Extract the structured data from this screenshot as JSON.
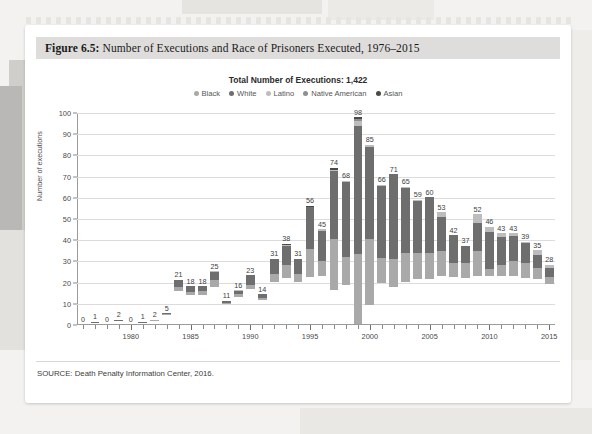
{
  "figure": {
    "label": "Figure 6.5:",
    "title": " Number of Executions and Race of Prisoners Executed, 1976–2015",
    "source": "SOURCE: Death Penalty Information Center, 2016."
  },
  "colors": {
    "black": "#a9a9a9",
    "white": "#6e6e6e",
    "latino": "#bdbdbd",
    "native_american": "#8f8f8f",
    "asian": "#4a4a4a",
    "gridline": "#dcdcdc",
    "axis": "#9b9b9b",
    "title_band": "#dedddb",
    "card": "#ffffff"
  },
  "chart_data": {
    "type": "bar",
    "stacked": true,
    "title": "Total Number of Executions: 1,422",
    "xlabel": "",
    "ylabel": "Number of executions",
    "ylim": [
      0,
      100
    ],
    "ytick_step": 10,
    "yticks": [
      0,
      10,
      20,
      30,
      40,
      50,
      60,
      70,
      80,
      90,
      100
    ],
    "grid": true,
    "legend_position": "top",
    "legend": [
      "Black",
      "White",
      "Latino",
      "Native American",
      "Asian"
    ],
    "categories": [
      "1976",
      "1977",
      "1978",
      "1979",
      "1980",
      "1981",
      "1982",
      "1983",
      "1984",
      "1985",
      "1986",
      "1987",
      "1988",
      "1989",
      "1990",
      "1991",
      "1992",
      "1993",
      "1994",
      "1995",
      "1996",
      "1997",
      "1998",
      "1999",
      "2000",
      "2001",
      "2002",
      "2003",
      "2004",
      "2005",
      "2006",
      "2007",
      "2008",
      "2009",
      "2010",
      "2011",
      "2012",
      "2013",
      "2014",
      "2015"
    ],
    "xtick_labels": [
      "1980",
      "1985",
      "1990",
      "1995",
      "2000",
      "2005",
      "2010",
      "2015"
    ],
    "totals": [
      0,
      1,
      0,
      2,
      0,
      1,
      2,
      5,
      21,
      18,
      18,
      25,
      11,
      16,
      23,
      14,
      31,
      38,
      31,
      56,
      45,
      74,
      68,
      98,
      85,
      66,
      71,
      65,
      59,
      60,
      53,
      42,
      37,
      52,
      46,
      43,
      43,
      39,
      35,
      28
    ],
    "series": [
      {
        "name": "Black",
        "color": "#a9a9a9",
        "values": [
          0,
          0,
          0,
          0,
          0,
          0,
          1,
          1,
          8,
          5,
          7,
          11,
          4,
          7,
          7,
          6,
          11,
          14,
          11,
          22,
          14,
          31,
          18,
          33,
          35,
          17,
          18,
          20,
          19,
          19,
          21,
          14,
          17,
          21,
          7,
          11,
          15,
          16,
          14,
          10
        ]
      },
      {
        "name": "White",
        "color": "#6e6e6e",
        "values": [
          0,
          1,
          0,
          2,
          0,
          1,
          1,
          4,
          13,
          13,
          11,
          13,
          6,
          8,
          16,
          8,
          19,
          22,
          19,
          33,
          29,
          41,
          49,
          61,
          49,
          48,
          53,
          44,
          39,
          41,
          28,
          28,
          20,
          24,
          34,
          28,
          25,
          22,
          15,
          14
        ]
      },
      {
        "name": "Latino",
        "color": "#bdbdbd",
        "values": [
          0,
          0,
          0,
          0,
          0,
          0,
          0,
          0,
          0,
          0,
          0,
          1,
          1,
          1,
          0,
          0,
          1,
          1,
          1,
          0,
          2,
          1,
          1,
          2,
          1,
          1,
          0,
          1,
          1,
          0,
          4,
          0,
          0,
          7,
          5,
          4,
          3,
          1,
          6,
          4
        ]
      },
      {
        "name": "Native American",
        "color": "#8f8f8f",
        "values": [
          0,
          0,
          0,
          0,
          0,
          0,
          0,
          0,
          0,
          0,
          0,
          0,
          0,
          0,
          0,
          0,
          0,
          0,
          0,
          0,
          0,
          0,
          0,
          1,
          0,
          0,
          0,
          0,
          0,
          0,
          0,
          0,
          0,
          0,
          0,
          0,
          0,
          0,
          0,
          0
        ]
      },
      {
        "name": "Asian",
        "color": "#4a4a4a",
        "values": [
          0,
          0,
          0,
          0,
          0,
          0,
          0,
          0,
          0,
          0,
          0,
          0,
          0,
          0,
          0,
          0,
          0,
          1,
          0,
          1,
          0,
          1,
          0,
          1,
          0,
          0,
          0,
          0,
          0,
          0,
          0,
          0,
          0,
          0,
          0,
          0,
          0,
          0,
          0,
          0
        ]
      }
    ]
  }
}
